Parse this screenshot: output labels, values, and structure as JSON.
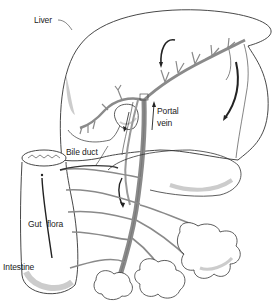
{
  "diagram": {
    "type": "anatomical illustration",
    "labels": {
      "liver": "Liver",
      "portal_vein_line1": "Portal",
      "portal_vein_line2": "vein",
      "bile_duct": "Bile duct",
      "gut": "Gut",
      "flora": "flora",
      "intestine": "Intestine"
    },
    "colors": {
      "outline": "#333333",
      "vessel": "#8a8a8a",
      "vessel_dark": "#555555",
      "shading": "#c9c9c9",
      "arrow": "#222222"
    }
  }
}
